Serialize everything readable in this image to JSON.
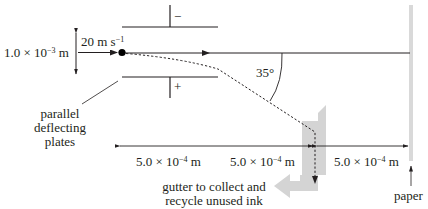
{
  "diagram": {
    "plate_separation": {
      "mantissa": "1.0 × 10",
      "exponent": "−3",
      "unit": " m"
    },
    "velocity": {
      "value": "20",
      "unit": " m s",
      "exponent": "−1"
    },
    "top_plate_sign": "−",
    "bottom_plate_sign": "+",
    "angle": "35°",
    "plates_label": [
      "parallel",
      "deflecting",
      "plates"
    ],
    "distances": [
      {
        "mantissa": "5.0 × 10",
        "exponent": "−4",
        "unit": " m"
      },
      {
        "mantissa": "5.0 × 10",
        "exponent": "−4",
        "unit": " m"
      },
      {
        "mantissa": "5.0 × 10",
        "exponent": "−4",
        "unit": " m"
      }
    ],
    "gutter_label": [
      "gutter to collect and",
      "recycle unused ink"
    ],
    "paper_label": "paper",
    "colors": {
      "ink": "#231f20",
      "paper": "#d9d9d9",
      "gutter": "#d4d4d4"
    }
  }
}
